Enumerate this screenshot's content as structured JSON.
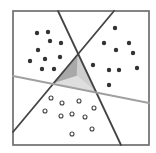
{
  "diagram": {
    "frame": {
      "x": 13,
      "y": 11,
      "w": 136,
      "h": 134,
      "stroke": "#666666"
    },
    "colors": {
      "dark_line": "#444444",
      "gray_line": "#a0a0a0",
      "filled_dot": "#333333",
      "hollow_dot_stroke": "#444444",
      "facet_left": "#a8a8a8",
      "facet_right": "#cfcfcf",
      "facet_bottom": "#dedede"
    },
    "lines": [
      {
        "id": "line-a",
        "x1": 58,
        "y1": 11,
        "x2": 121,
        "y2": 145,
        "kind": "dark"
      },
      {
        "id": "line-b",
        "x1": 114,
        "y1": 11,
        "x2": 13,
        "y2": 132,
        "kind": "dark"
      },
      {
        "id": "line-c",
        "x1": 13,
        "y1": 76,
        "x2": 149,
        "y2": 103,
        "kind": "gray"
      }
    ],
    "triangle": {
      "vertices": [
        [
          78,
          54
        ],
        [
          52,
          84
        ],
        [
          96,
          92
        ]
      ],
      "center": [
        77,
        76
      ]
    },
    "filled_points": [
      [
        37,
        33
      ],
      [
        48,
        32
      ],
      [
        50,
        41
      ],
      [
        61,
        43
      ],
      [
        38,
        50
      ],
      [
        30,
        61
      ],
      [
        45,
        59
      ],
      [
        60,
        57
      ],
      [
        42,
        69
      ],
      [
        54,
        69
      ],
      [
        115,
        28
      ],
      [
        104,
        43
      ],
      [
        129,
        43
      ],
      [
        116,
        50
      ],
      [
        133,
        53
      ],
      [
        93,
        65
      ],
      [
        109,
        70
      ],
      [
        119,
        70
      ],
      [
        137,
        68
      ],
      [
        109,
        85
      ]
    ],
    "hollow_points": [
      [
        51,
        98
      ],
      [
        62,
        103
      ],
      [
        79,
        101
      ],
      [
        94,
        108
      ],
      [
        45,
        111
      ],
      [
        61,
        116
      ],
      [
        72,
        114
      ],
      [
        85,
        117
      ],
      [
        92,
        129
      ],
      [
        72,
        134
      ]
    ]
  }
}
